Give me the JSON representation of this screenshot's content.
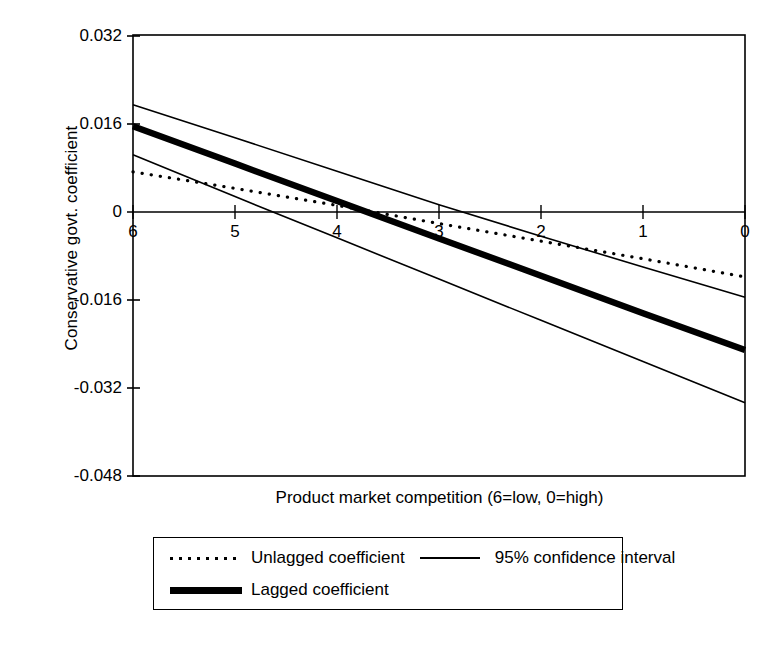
{
  "chart_data": {
    "type": "line",
    "title": "",
    "xlabel": "Product market competition (6=low, 0=high)",
    "ylabel": "Conservative govt. coefficient",
    "xlim": [
      6,
      0
    ],
    "ylim": [
      -0.048,
      0.032
    ],
    "x_reversed": true,
    "grid": false,
    "zero_line": true,
    "legend_position": "below-plot",
    "xticks": [
      "6",
      "5",
      "4",
      "3",
      "2",
      "1",
      "0"
    ],
    "xtick_values": [
      6,
      5,
      4,
      3,
      2,
      1,
      0
    ],
    "yticks": [
      "0.032",
      "0.016",
      "0",
      "-0.016",
      "-0.032",
      "-0.048"
    ],
    "ytick_values": [
      0.032,
      0.016,
      0,
      -0.016,
      -0.032,
      -0.048
    ],
    "x": [
      6,
      5,
      4,
      3,
      2,
      1,
      0
    ],
    "series": [
      {
        "name": "Lagged coefficient",
        "style": "thick-solid",
        "color": "#000000",
        "values": [
          0.0156,
          0.0088,
          0.002,
          -0.0048,
          -0.0116,
          -0.0184,
          -0.0251
        ]
      },
      {
        "name": "Unlagged coefficient",
        "style": "dotted",
        "color": "#000000",
        "values": [
          0.0073,
          0.0043,
          0.0012,
          -0.0021,
          -0.0053,
          -0.0085,
          -0.0118
        ]
      },
      {
        "name": "95% confidence interval",
        "style": "thin-solid",
        "color": "#000000",
        "bound": "upper",
        "values": [
          0.0195,
          0.0135,
          0.0074,
          0.0013,
          -0.0044,
          -0.01,
          -0.0155
        ]
      },
      {
        "name": "95% confidence interval",
        "style": "thin-solid",
        "color": "#000000",
        "bound": "lower",
        "values": [
          0.0104,
          0.0028,
          -0.0047,
          -0.0122,
          -0.0197,
          -0.0272,
          -0.0347
        ]
      }
    ]
  },
  "axes": {
    "ylabel": "Conservative govt. coefficient",
    "xlabel": "Product market competition (6=low, 0=high)",
    "ytick_labels": [
      "0.032",
      "0.016",
      "0",
      "-0.016",
      "-0.032",
      "-0.048"
    ],
    "xtick_labels": [
      "6",
      "5",
      "4",
      "3",
      "2",
      "1",
      "0"
    ]
  },
  "legend": {
    "entries": [
      {
        "label": "Unlagged coefficient",
        "swatch": "dotted-line-swatch"
      },
      {
        "label": "95% confidence interval",
        "swatch": "thin-line-swatch"
      },
      {
        "label": "Lagged coefficient",
        "swatch": "thick-line-swatch"
      }
    ]
  }
}
